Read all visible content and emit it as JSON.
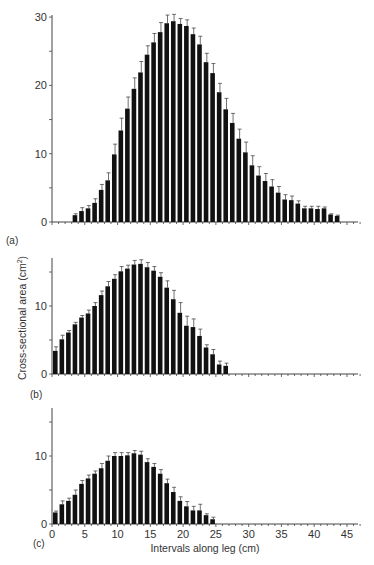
{
  "figure": {
    "ylabel": "Cross-sectional area (cm²)",
    "ylabel_base": "Cross-sectional area (cm",
    "ylabel_sup": "2",
    "ylabel_close": ")",
    "xlabel": "Intervals along leg (cm)",
    "x_ticks": [
      "0",
      "5",
      "10",
      "15",
      "20",
      "25",
      "30",
      "35",
      "40",
      "45"
    ],
    "bar_color": "#111111",
    "axis_color": "#444444"
  },
  "chart_data": [
    {
      "type": "bar",
      "panel": "(a)",
      "title": "",
      "xlabel": "Intervals along leg (cm)",
      "ylabel": "Cross-sectional area (cm²)",
      "ylim": [
        0,
        30
      ],
      "xlim": [
        0,
        47
      ],
      "y_ticks": [
        "0",
        "10",
        "20",
        "30"
      ],
      "error_bars": true,
      "grid": false,
      "x_start": 3,
      "values": [
        1.0,
        1.6,
        2.0,
        2.8,
        4.7,
        6.1,
        9.9,
        13.4,
        16.6,
        19.5,
        21.9,
        24.5,
        26.3,
        27.8,
        29.1,
        29.4,
        29.0,
        28.7,
        27.5,
        26.0,
        23.4,
        21.8,
        19.0,
        16.5,
        14.5,
        12.2,
        10.2,
        8.3,
        6.8,
        6.0,
        5.2,
        4.3,
        3.3,
        3.2,
        2.7,
        2.0,
        2.0,
        1.9,
        2.0,
        1.1,
        0.9
      ],
      "errors": [
        0.2,
        0.5,
        0.4,
        0.6,
        0.8,
        1.1,
        1.5,
        1.8,
        1.7,
        1.6,
        1.6,
        1.3,
        1.3,
        1.4,
        1.2,
        1.0,
        0.8,
        0.9,
        0.9,
        1.2,
        1.3,
        1.4,
        1.3,
        1.6,
        1.4,
        1.4,
        1.5,
        1.4,
        1.3,
        1.1,
        1.0,
        0.9,
        0.7,
        0.6,
        0.4,
        0.3,
        0.3,
        0.4,
        0.2,
        0.1,
        0.1
      ]
    },
    {
      "type": "bar",
      "panel": "(b)",
      "title": "",
      "xlabel": "Intervals along leg (cm)",
      "ylabel": "Cross-sectional area (cm²)",
      "ylim": [
        0,
        17
      ],
      "xlim": [
        0,
        47
      ],
      "y_ticks": [
        "0",
        "10"
      ],
      "error_bars": true,
      "grid": false,
      "x_start": 0,
      "values": [
        3.4,
        5.1,
        6.1,
        7.3,
        8.3,
        8.9,
        10.0,
        11.6,
        12.9,
        14.0,
        15.1,
        15.5,
        16.1,
        16.2,
        15.7,
        15.2,
        14.3,
        12.7,
        11.0,
        9.0,
        7.1,
        6.9,
        5.6,
        3.9,
        2.9,
        1.4,
        1.2
      ],
      "errors": [
        0.6,
        0.6,
        0.3,
        0.3,
        0.3,
        0.5,
        0.5,
        0.6,
        0.7,
        0.6,
        0.7,
        0.5,
        0.6,
        0.6,
        0.7,
        0.6,
        0.6,
        1.0,
        1.3,
        1.5,
        1.4,
        1.2,
        1.0,
        0.4,
        0.7,
        0.5,
        0.4
      ]
    },
    {
      "type": "bar",
      "panel": "(c)",
      "title": "",
      "xlabel": "Intervals along leg (cm)",
      "ylabel": "Cross-sectional area (cm²)",
      "ylim": [
        0,
        17
      ],
      "xlim": [
        0,
        47
      ],
      "y_ticks": [
        "0",
        "10"
      ],
      "error_bars": true,
      "grid": false,
      "x_start": 0,
      "values": [
        1.7,
        2.9,
        3.4,
        4.3,
        5.9,
        6.7,
        7.4,
        8.2,
        9.3,
        10.0,
        10.0,
        10.1,
        10.4,
        10.2,
        9.1,
        8.4,
        7.4,
        6.0,
        4.7,
        3.4,
        2.6,
        2.0,
        2.0,
        1.3,
        0.7
      ],
      "errors": [
        0.2,
        0.5,
        0.4,
        0.7,
        0.5,
        0.5,
        0.4,
        0.7,
        0.7,
        0.5,
        0.5,
        0.4,
        0.4,
        0.5,
        0.5,
        0.5,
        0.6,
        0.6,
        0.7,
        0.6,
        0.7,
        0.6,
        0.9,
        0.2,
        0.3
      ]
    }
  ]
}
